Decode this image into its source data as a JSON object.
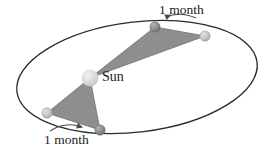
{
  "figure": {
    "title_visible": false,
    "caption": "",
    "labels": {
      "sun": "Sun",
      "month_top": "1 month",
      "month_bottom": "1 month"
    },
    "colors": {
      "background": "#ffffff",
      "orbit_line": "#2b2b2b",
      "sector_fill": "#8e8e8e",
      "sector_stroke": "#6f6f6f",
      "sun_body": "#d2d2d2",
      "sun_highlight": "#ececec",
      "planet_dark": "#8a8a8a",
      "planet_light": "#c2c2c2",
      "arrow": "#4a4a4a",
      "text": "#1c1c1c"
    },
    "orbit": {
      "center_x": 137,
      "center_y": 77,
      "radius_x": 121,
      "radius_y": 55,
      "rotation_deg": -7
    },
    "sun": {
      "x": 90,
      "y": 78,
      "radius": 8
    },
    "planets": [
      {
        "name": "upper-left-position",
        "x": 155,
        "y": 27,
        "radius": 5,
        "shade": "dark"
      },
      {
        "name": "upper-right-position",
        "x": 205,
        "y": 36,
        "radius": 5,
        "shade": "light"
      },
      {
        "name": "lower-left-position",
        "x": 47,
        "y": 113,
        "radius": 5,
        "shade": "light"
      },
      {
        "name": "lower-right-position",
        "x": 100,
        "y": 130,
        "radius": 5,
        "shade": "dark"
      }
    ],
    "sectors": [
      {
        "name": "upper-sector",
        "points": "90,78 155,27 205,36",
        "description": "swept area over one month near aphelion"
      },
      {
        "name": "lower-sector",
        "points": "90,78 47,113 100,130",
        "description": "swept area over one month near perihelion"
      }
    ],
    "arrows": [
      {
        "name": "arrow-top",
        "direction": "left",
        "path": "M 196 18 Q 180 11 164 17"
      },
      {
        "name": "arrow-bottom",
        "direction": "right",
        "path": "M 50 131 Q 64 123 80 127"
      }
    ]
  }
}
